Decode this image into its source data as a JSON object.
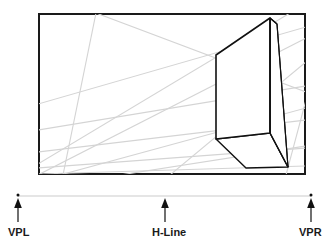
{
  "figure": {
    "frame": {
      "x": 38,
      "y": 13,
      "width": 268,
      "height": 162,
      "stroke_color": "#1a1a1a",
      "stroke_width": 2,
      "fill_color": "#ffffff"
    },
    "colors": {
      "frame_stroke": "#1a1a1a",
      "guide_line": "#d2d2d2",
      "box_stroke": "#111111",
      "box_fill": "#ffffff",
      "horizon_line": "#cccccc",
      "marker": "#111111",
      "label_text": "#1a1a1a"
    }
  },
  "horizon": {
    "line": {
      "x1": 18,
      "y1": 196,
      "x2": 311,
      "y2": 196,
      "stroke_color": "#cccccc",
      "stroke_width": 1
    },
    "markers": [
      {
        "name": "vpl",
        "label": "VPL",
        "dot_x": 18,
        "dot_y": 196,
        "arrow_x": 18,
        "arrow_top": 200,
        "arrow_bottom": 222
      },
      {
        "name": "hline",
        "label": "H-Line",
        "dot_x": 165,
        "dot_y": 196,
        "arrow_x": 165,
        "arrow_top": 200,
        "arrow_bottom": 222
      },
      {
        "name": "vpr",
        "label": "VPR",
        "dot_x": 311,
        "dot_y": 196,
        "arrow_x": 311,
        "arrow_top": 200,
        "arrow_bottom": 222
      }
    ]
  },
  "labels": {
    "vpl": "VPL",
    "hline": "H-Line",
    "vpr": "VPR"
  },
  "guide_lines": [
    {
      "name": "guide-vpl-1",
      "x1": 38,
      "y1": 104,
      "x2": 306,
      "y2": 27
    },
    {
      "name": "guide-vpl-2",
      "x1": 38,
      "y1": 130,
      "x2": 306,
      "y2": 86
    },
    {
      "name": "guide-vpl-3",
      "x1": 38,
      "y1": 152,
      "x2": 306,
      "y2": 120
    },
    {
      "name": "guide-vpl-4",
      "x1": 38,
      "y1": 168,
      "x2": 306,
      "y2": 148
    },
    {
      "name": "guide-vpl-5",
      "x1": 38,
      "y1": 174,
      "x2": 306,
      "y2": 166
    },
    {
      "name": "guide-vpr-1",
      "x1": 306,
      "y1": 38,
      "x2": 38,
      "y2": 175
    },
    {
      "name": "guide-vpr-2",
      "x1": 290,
      "y1": 13,
      "x2": 38,
      "y2": 164
    },
    {
      "name": "guide-vpr-3",
      "x1": 306,
      "y1": 108,
      "x2": 60,
      "y2": 175
    },
    {
      "name": "guide-vpr-4",
      "x1": 306,
      "y1": 146,
      "x2": 120,
      "y2": 175
    },
    {
      "name": "guide-conv-1",
      "x1": 96,
      "y1": 13,
      "x2": 63,
      "y2": 175
    },
    {
      "name": "guide-conv-2",
      "x1": 96,
      "y1": 13,
      "x2": 306,
      "y2": 92
    },
    {
      "name": "guide-conv-3",
      "x1": 286,
      "y1": 175,
      "x2": 306,
      "y2": 100
    }
  ],
  "box": {
    "name": "perspective-box",
    "vertices": {
      "top_apex": {
        "x": 270,
        "y": 18
      },
      "front_top_left": {
        "x": 216,
        "y": 55
      },
      "front_bot_left": {
        "x": 216,
        "y": 139
      },
      "front_bot_mid": {
        "x": 263,
        "y": 152
      },
      "front_top_mid": {
        "x": 270,
        "y": 18
      },
      "right_top": {
        "x": 277,
        "y": 24
      },
      "right_bot": {
        "x": 288,
        "y": 167
      },
      "base_right": {
        "x": 288,
        "y": 167
      },
      "base_front": {
        "x": 246,
        "y": 168
      }
    },
    "faces": [
      {
        "name": "front-face",
        "points": "216,55 270,18 270,133 216,139"
      },
      {
        "name": "right-face",
        "points": "270,18 277,24 288,167 270,133"
      },
      {
        "name": "bottom-face",
        "points": "216,139 270,133 288,167 246,168"
      }
    ]
  }
}
